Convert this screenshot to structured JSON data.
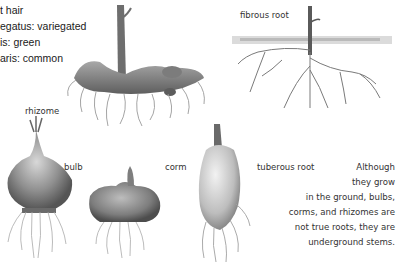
{
  "legend": {
    "lines": [
      "t hair",
      "egatus: variegated",
      "is: green",
      "aris: common"
    ]
  },
  "labels": {
    "fibrous_root": "fibrous root",
    "rhizome": "rhizome",
    "bulb": "bulb",
    "corm": "corm",
    "tuberous_root": "tuberous root"
  },
  "note": {
    "lines": [
      "Although",
      "they grow",
      "in the ground, bulbs,",
      "corms, and rhizomes are",
      "not true roots, they are",
      "underground stems."
    ]
  },
  "colors": {
    "background": "#ffffff",
    "text": "#333333",
    "illustration_dark": "#4a4a4a",
    "illustration_mid": "#8c8c8c",
    "illustration_light": "#c9c9c9"
  }
}
